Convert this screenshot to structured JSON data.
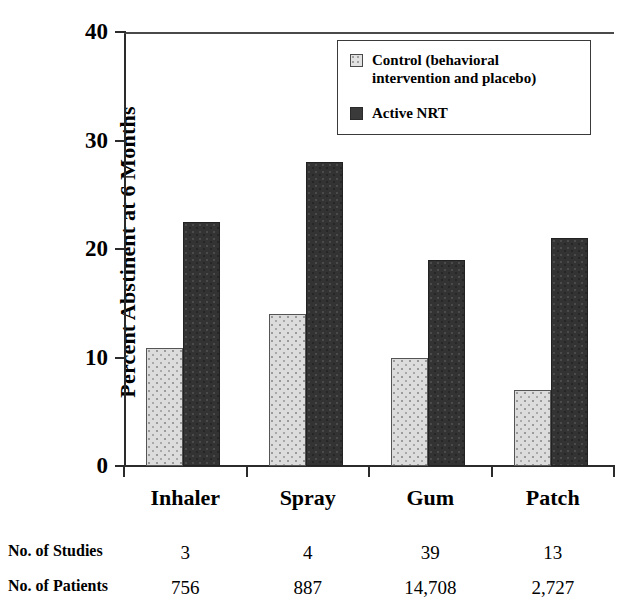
{
  "chart_data": {
    "type": "bar",
    "title": "",
    "xlabel": "",
    "ylabel": "Percent Abstinent at 6 Months",
    "ylim": [
      0,
      40
    ],
    "yticks": [
      0,
      10,
      20,
      30,
      40
    ],
    "ytick_labels": [
      "0",
      "10",
      "20",
      "30",
      "40"
    ],
    "grid": false,
    "legend_position": "top-right",
    "categories": [
      "Inhaler",
      "Spray",
      "Gum",
      "Patch"
    ],
    "series": [
      {
        "name": "Control (behavioral intervention and placebo)",
        "short_name": "Control",
        "color": "#dcdcdc",
        "values": [
          10.9,
          14.0,
          10.0,
          7.0
        ]
      },
      {
        "name": "Active NRT",
        "short_name": "Active NRT",
        "color": "#333333",
        "values": [
          22.5,
          28.0,
          19.0,
          21.0
        ]
      }
    ],
    "annotations": {
      "row_labels": [
        "No. of Studies",
        "No. of Patients"
      ],
      "rows": [
        {
          "label": "No. of Studies",
          "values": [
            "3",
            "4",
            "39",
            "13"
          ]
        },
        {
          "label": "No. of Patients",
          "values": [
            "756",
            "887",
            "14,708",
            "2,727"
          ]
        }
      ]
    }
  },
  "legend": {
    "items": [
      {
        "label": "Control (behavioral intervention and placebo)",
        "swatch": "control"
      },
      {
        "label": "Active NRT",
        "swatch": "nrt"
      }
    ]
  },
  "axis": {
    "y_title": "Percent Abstinent at 6 Months",
    "y_ticks": [
      "40",
      "30",
      "20",
      "10",
      "0"
    ]
  },
  "categories": {
    "items": [
      "Inhaler",
      "Spray",
      "Gum",
      "Patch"
    ]
  },
  "table": {
    "studies_label": "No. of Studies",
    "patients_label": "No. of Patients",
    "studies": [
      "3",
      "4",
      "39",
      "13"
    ],
    "patients": [
      "756",
      "887",
      "14,708",
      "2,727"
    ]
  },
  "colors": {
    "control_fill": "#dcdcdc",
    "nrt_fill": "#333333",
    "axis": "#2b2b2b",
    "background": "#ffffff"
  }
}
